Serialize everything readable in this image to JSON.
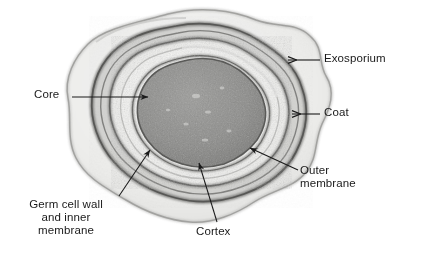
{
  "figure": {
    "kind": "micrograph-line-drawing",
    "background_color": "#ffffff",
    "ink_color": "#1a1a1a"
  },
  "labels": [
    {
      "id": "exosporium",
      "text": "Exosporium",
      "leader": "horizontal-arrow-left",
      "arrow_target": "outermost irregular envelope"
    },
    {
      "id": "coat",
      "text": "Coat",
      "leader": "horizontal-arrow-left",
      "arrow_target": "dark thick ring beneath exosporium"
    },
    {
      "id": "outer_membrane",
      "text": "Outer\nmembrane",
      "leader": "diagonal-line-upper-left",
      "arrow_target": "ring inside the coat"
    },
    {
      "id": "cortex",
      "text": "Cortex",
      "leader": "diagonal-arrow-upper-left",
      "arrow_target": "pale band between core and outer membrane"
    },
    {
      "id": "core",
      "text": "Core",
      "leader": "horizontal-arrow-right",
      "arrow_target": "dark granular centre"
    },
    {
      "id": "germ_cell_wall",
      "text": "Germ cell wall\nand inner\nmembrane",
      "leader": "diagonal-arrow-upper-right",
      "arrow_target": "thin boundary around the core"
    }
  ],
  "structures": [
    {
      "id": "exosporium",
      "role": "outermost layer",
      "tone": "light-gray"
    },
    {
      "id": "coat",
      "role": "thick dark ring",
      "tone": "dark-gray"
    },
    {
      "id": "outer_membrane",
      "role": "ring",
      "tone": "medium-gray"
    },
    {
      "id": "cortex",
      "role": "pale band",
      "tone": "very-light"
    },
    {
      "id": "germ_cell_wall",
      "role": "thin boundary",
      "tone": "medium-gray"
    },
    {
      "id": "core",
      "role": "granular centre",
      "tone": "dark-gray"
    }
  ],
  "colors": {
    "paper": "#ffffff",
    "core_fill": "#8a8a8a",
    "core_edge": "#6e6e6e",
    "cortex_fill": "#f2f2f0",
    "outer_membrane": "#9a9a98",
    "coat": "#8f8f8d",
    "exosporium": "#d8d8d6",
    "ink": "#1a1a1a"
  }
}
